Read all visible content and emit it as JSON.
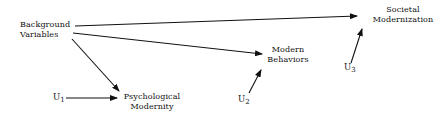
{
  "diagram": {
    "type": "path-diagram",
    "nodes": {
      "background": {
        "line1": "Background",
        "line2": "Variables"
      },
      "societal": {
        "line1": "Societal",
        "line2": "Modernization"
      },
      "behaviors": {
        "line1": "Modern",
        "line2": "Behaviors"
      },
      "psych": {
        "line1": "Psychological",
        "line2": "Modernity"
      },
      "u1": {
        "base": "U",
        "sub": "1"
      },
      "u2": {
        "base": "U",
        "sub": "2"
      },
      "u3": {
        "base": "U",
        "sub": "3"
      }
    },
    "edges": [
      {
        "from": "Background Variables",
        "to": "Societal Modernization"
      },
      {
        "from": "Background Variables",
        "to": "Modern Behaviors"
      },
      {
        "from": "Background Variables",
        "to": "Psychological Modernity"
      },
      {
        "from": "U1",
        "to": "Psychological Modernity"
      },
      {
        "from": "U2",
        "to": "Modern Behaviors"
      },
      {
        "from": "U3",
        "to": "Societal Modernization"
      }
    ]
  }
}
